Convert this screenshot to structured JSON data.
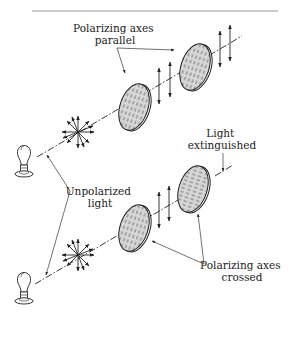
{
  "figure": {
    "labels": {
      "parallel_line1": "Polarizing axes",
      "parallel_line2": "parallel",
      "extinguished_line1": "Light",
      "extinguished_line2": "extinguished",
      "unpolarized_line1": "Unpolarized",
      "unpolarized_line2": "light",
      "crossed_line1": "Polarizing axes",
      "crossed_line2": "crossed"
    },
    "setups": [
      {
        "name": "parallel",
        "source": "light-bulb",
        "polarizer_1_axis": "vertical",
        "polarizer_2_axis": "vertical",
        "output": "vertically polarized light"
      },
      {
        "name": "crossed",
        "source": "light-bulb",
        "polarizer_1_axis": "vertical",
        "polarizer_2_axis": "horizontal",
        "output": "light extinguished"
      }
    ],
    "colors": {
      "ink": "#222222",
      "filter_fill": "#d8d8d8",
      "background": "#ffffff",
      "rule": "#999999"
    }
  }
}
